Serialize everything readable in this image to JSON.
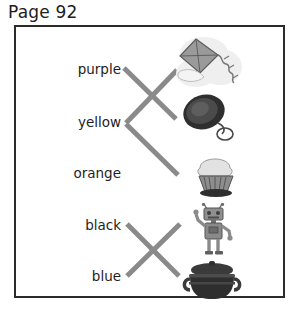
{
  "page": {
    "title": "Page 92",
    "type": "matching-worksheet"
  },
  "colors": {
    "title_text": "#1d1d1d",
    "frame_border": "#2b2b2b",
    "word_text": "#1e1e1e",
    "line_stroke": "#8a8a8a",
    "page_background": "#ffffff",
    "art_dark": "#3a3a3a",
    "art_mid": "#777777",
    "art_light": "#c9c9c9"
  },
  "words": [
    {
      "label": "purple"
    },
    {
      "label": "yellow"
    },
    {
      "label": "orange"
    },
    {
      "label": "black"
    },
    {
      "label": "blue"
    }
  ],
  "pictures": [
    {
      "name": "kite",
      "alt": "kite"
    },
    {
      "name": "yo-yo",
      "alt": "yo-yo"
    },
    {
      "name": "cupcake",
      "alt": "cupcake"
    },
    {
      "name": "robot",
      "alt": "robot"
    },
    {
      "name": "pot",
      "alt": "pot"
    }
  ],
  "lines": [
    {
      "from": "purple",
      "to": "yo-yo",
      "x1": 124,
      "y1": 68,
      "x2": 176,
      "y2": 119
    },
    {
      "from": "yellow",
      "to": "kite",
      "x1": 126,
      "y1": 123,
      "x2": 177,
      "y2": 70
    },
    {
      "from": "yellow",
      "to": "cupcake",
      "x1": 126,
      "y1": 124,
      "x2": 178,
      "y2": 175
    },
    {
      "from": "black",
      "to": "pot",
      "x1": 127,
      "y1": 224,
      "x2": 179,
      "y2": 276
    },
    {
      "from": "blue",
      "to": "robot",
      "x1": 127,
      "y1": 276,
      "x2": 180,
      "y2": 224
    }
  ]
}
